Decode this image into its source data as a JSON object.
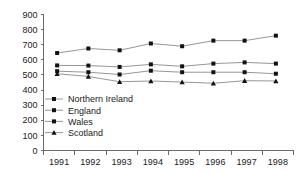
{
  "chart_data": {
    "type": "line",
    "title": "",
    "subtitle": "",
    "xlabel": "",
    "ylabel": "",
    "categories": [
      "1991",
      "1992",
      "1993",
      "1994",
      "1995",
      "1996",
      "1997",
      "1998"
    ],
    "ylim": [
      0,
      900
    ],
    "yticks": [
      0,
      100,
      200,
      300,
      400,
      500,
      600,
      700,
      800,
      900
    ],
    "ytick_labels": [
      "0",
      "100",
      "200",
      "300",
      "400",
      "500",
      "600",
      "700",
      "800",
      "900"
    ],
    "grid": false,
    "legend_position": "inside-lower-left",
    "series": [
      {
        "name": "Northern Ireland",
        "marker": "square",
        "values": [
          645,
          675,
          663,
          708,
          690,
          727,
          727,
          760
        ]
      },
      {
        "name": "England",
        "marker": "square",
        "values": [
          563,
          562,
          553,
          570,
          557,
          575,
          583,
          575
        ]
      },
      {
        "name": "Wales",
        "marker": "square",
        "values": [
          525,
          518,
          503,
          528,
          518,
          518,
          518,
          508
        ]
      },
      {
        "name": "Scotland",
        "marker": "triangle",
        "values": [
          508,
          490,
          455,
          460,
          453,
          445,
          462,
          460
        ]
      }
    ],
    "colors": {
      "line": "#8a8a8a",
      "marker": "#121212",
      "axis": "#6b6b6b",
      "text": "#1a1a1a",
      "background": "#ffffff"
    }
  },
  "legend": {
    "entries": [
      {
        "label": "Northern Ireland"
      },
      {
        "label": "England"
      },
      {
        "label": "Wales"
      },
      {
        "label": "Scotland"
      }
    ]
  }
}
